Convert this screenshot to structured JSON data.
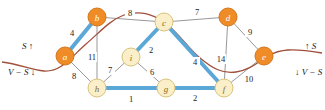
{
  "figure": {
    "colors": {
      "node_in_S": "#F08C28",
      "node_in_V_minus_S": "#FAEFC8",
      "node_stroke_S": "#D4761A",
      "node_stroke_V_minus_S": "#D9C27A",
      "tree_edge": "#5BA8D8",
      "plain_edge": "#8C8C8C",
      "cut_curve": "#A0503C",
      "background": "#FFFFFF"
    }
  },
  "nodes": [
    {
      "id": "a",
      "label": "a",
      "x": 65,
      "y": 56,
      "set": "S",
      "r": 9
    },
    {
      "id": "b",
      "label": "b",
      "x": 97,
      "y": 17,
      "set": "S",
      "r": 9
    },
    {
      "id": "c",
      "label": "c",
      "x": 164,
      "y": 22,
      "set": "V-S",
      "r": 9
    },
    {
      "id": "d",
      "label": "d",
      "x": 228,
      "y": 17,
      "set": "S",
      "r": 9
    },
    {
      "id": "e",
      "label": "e",
      "x": 264,
      "y": 56,
      "set": "S",
      "r": 9
    },
    {
      "id": "f",
      "label": "f",
      "x": 224,
      "y": 88,
      "set": "V-S",
      "r": 9
    },
    {
      "id": "g",
      "label": "g",
      "x": 166,
      "y": 88,
      "set": "V-S",
      "r": 9
    },
    {
      "id": "h",
      "label": "h",
      "x": 97,
      "y": 88,
      "set": "V-S",
      "r": 9
    },
    {
      "id": "i",
      "label": "i",
      "x": 131,
      "y": 57,
      "set": "V-S",
      "r": 9
    }
  ],
  "edges": [
    {
      "from": "a",
      "to": "b",
      "weight": "4",
      "wx": 72,
      "wy": 33,
      "tree": true
    },
    {
      "from": "a",
      "to": "h",
      "weight": "8",
      "wx": 74,
      "wy": 76,
      "tree": false
    },
    {
      "from": "b",
      "to": "c",
      "weight": "8",
      "wx": 130,
      "wy": 13,
      "tree": false
    },
    {
      "from": "b",
      "to": "h",
      "weight": "11",
      "wx": 92,
      "wy": 57,
      "tree": false
    },
    {
      "from": "c",
      "to": "d",
      "weight": "7",
      "wx": 197,
      "wy": 12,
      "tree": false
    },
    {
      "from": "c",
      "to": "i",
      "weight": "2",
      "wx": 151,
      "wy": 50,
      "tree": true
    },
    {
      "from": "c",
      "to": "f",
      "weight": "4",
      "wx": 195,
      "wy": 62,
      "tree": true
    },
    {
      "from": "d",
      "to": "e",
      "weight": "9",
      "wx": 250,
      "wy": 32,
      "tree": false
    },
    {
      "from": "d",
      "to": "f",
      "weight": "14",
      "wx": 221,
      "wy": 59,
      "tree": false
    },
    {
      "from": "e",
      "to": "f",
      "weight": "10",
      "wx": 249,
      "wy": 79,
      "tree": false
    },
    {
      "from": "f",
      "to": "g",
      "weight": "2",
      "wx": 195,
      "wy": 98,
      "tree": true
    },
    {
      "from": "g",
      "to": "h",
      "weight": "1",
      "wx": 131,
      "wy": 99,
      "tree": true
    },
    {
      "from": "h",
      "to": "i",
      "weight": "7",
      "wx": 110,
      "wy": 70,
      "tree": false
    },
    {
      "from": "i",
      "to": "g",
      "weight": "6",
      "wx": 152,
      "wy": 72,
      "tree": false
    }
  ],
  "cut_labels": {
    "left_top": {
      "text": "S",
      "arrow": "↑",
      "x": 22,
      "y": 46
    },
    "left_bottom": {
      "text": "V − S",
      "arrow": "↓",
      "x": 8,
      "y": 72
    },
    "right_top": {
      "text": "S",
      "arrow": "↑",
      "x": 305,
      "y": 46
    },
    "right_bottom": {
      "text": "V − S",
      "arrow": "↓",
      "x": 295,
      "y": 72
    }
  },
  "cut_curve": {
    "path": "M 2,62 C 20,64 30,70 44,71 C 62,72 72,56 86,44 C 100,32 110,20 124,15 C 140,10 152,14 164,22 C 178,32 188,48 200,58 C 212,68 222,74 236,72 C 250,70 258,62 268,56 C 280,49 292,48 322,53"
  }
}
